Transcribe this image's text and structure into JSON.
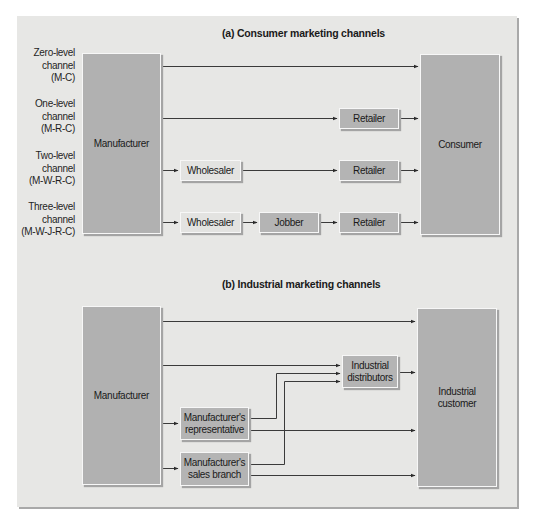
{
  "section_a": {
    "title": "(a) Consumer marketing channels",
    "channels": [
      {
        "line1": "Zero-level",
        "line2": "channel",
        "line3": "(M-C)"
      },
      {
        "line1": "One-level",
        "line2": "channel",
        "line3": "(M-R-C)"
      },
      {
        "line1": "Two-level",
        "line2": "channel",
        "line3": "(M-W-R-C)"
      },
      {
        "line1": "Three-level",
        "line2": "channel",
        "line3": "(M-W-J-R-C)"
      }
    ],
    "source": "Manufacturer",
    "target": "Consumer",
    "intermediaries": {
      "wholesaler": "Wholesaler",
      "jobber": "Jobber",
      "retailer": "Retailer"
    }
  },
  "section_b": {
    "title": "(b) Industrial marketing channels",
    "source": "Manufacturer",
    "target_line1": "Industrial",
    "target_line2": "customer",
    "distributors_line1": "Industrial",
    "distributors_line2": "distributors",
    "rep_line1": "Manufacturer's",
    "rep_line2": "representative",
    "branch_line1": "Manufacturer's",
    "branch_line2": "sales branch"
  },
  "colors": {
    "panel_bg": "#e7e7e5",
    "box_dark": "#b1b1b1",
    "box_light": "#e3e3e1",
    "line": "#3a3a3a"
  }
}
